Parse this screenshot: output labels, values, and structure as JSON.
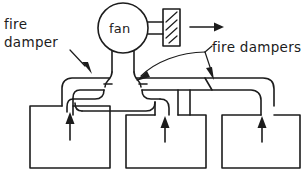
{
  "diagram": {
    "labels": {
      "left_damper_line1": "fire",
      "left_damper_line2": "damper",
      "fan": "fan",
      "right_dampers": "fire dampers"
    },
    "colors": {
      "ink": "#1c1c1c",
      "background": "#ffffff"
    },
    "elements": {
      "fan_symbol": "circle",
      "discharge_symbol": "hatched-rectangle",
      "discharge_arrow_direction": "right",
      "room_count": 3,
      "room_airflow_arrow_direction": "up",
      "damper_count": 3,
      "leader_arrow_count": 3
    }
  }
}
